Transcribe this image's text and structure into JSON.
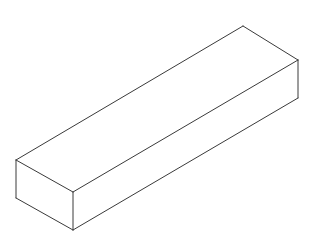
{
  "canvas": {
    "width": 315,
    "height": 242,
    "background_color": "#ffffff",
    "title": "Isometric rectangular box (beam) wireframe drawing"
  },
  "drawing": {
    "name": "rectangular-box",
    "type": "isometric-line-drawing",
    "line_color": "#3a3a3a",
    "line_width": 1,
    "fill_color": "#ffffff",
    "description": "A long rectangular box (cuboid / beam) drawn in isometric projection, outlined in thin dark gray lines on a white background. Three faces are visible: the large top face, the left end face, and the long front-lower face.",
    "vertices": {
      "top_back_left": {
        "x": 16,
        "y": 160
      },
      "top_back_apex": {
        "x": 243,
        "y": 26
      },
      "top_front_right": {
        "x": 298,
        "y": 60
      },
      "top_front_center": {
        "x": 73,
        "y": 192
      },
      "bottom_front_left": {
        "x": 16,
        "y": 198
      },
      "bottom_front_center": {
        "x": 73,
        "y": 230
      },
      "bottom_front_right": {
        "x": 298,
        "y": 98
      }
    },
    "faces": [
      {
        "name": "top-face",
        "label": "Top Face",
        "points": "16,160 243,26 298,60 73,192"
      },
      {
        "name": "left-end-face",
        "label": "Left End Face",
        "points": "16,160 73,192 73,230 16,198"
      },
      {
        "name": "front-face",
        "label": "Front Long Face",
        "points": "73,192 298,60 298,98 73,230"
      }
    ],
    "edges": [
      {
        "name": "top-back-long-edge",
        "label": "Top back long edge",
        "x1": 16,
        "y1": 160,
        "x2": 243,
        "y2": 26
      },
      {
        "name": "top-right-short-edge",
        "label": "Top right short edge",
        "x1": 243,
        "y1": 26,
        "x2": 298,
        "y2": 60
      },
      {
        "name": "top-front-long-edge",
        "label": "Top front long edge",
        "x1": 73,
        "y1": 192,
        "x2": 298,
        "y2": 60
      },
      {
        "name": "top-left-short-edge",
        "label": "Top left short edge",
        "x1": 16,
        "y1": 160,
        "x2": 73,
        "y2": 192
      },
      {
        "name": "left-vertical-edge",
        "label": "Left vertical edge",
        "x1": 16,
        "y1": 160,
        "x2": 16,
        "y2": 198
      },
      {
        "name": "center-vertical-edge",
        "label": "Front corner vertical edge",
        "x1": 73,
        "y1": 192,
        "x2": 73,
        "y2": 230
      },
      {
        "name": "right-vertical-edge",
        "label": "Right vertical edge",
        "x1": 298,
        "y1": 60,
        "x2": 298,
        "y2": 98
      },
      {
        "name": "bottom-left-short-edge",
        "label": "Bottom left short edge",
        "x1": 16,
        "y1": 198,
        "x2": 73,
        "y2": 230
      },
      {
        "name": "bottom-front-long-edge",
        "label": "Bottom front long edge",
        "x1": 73,
        "y1": 230,
        "x2": 298,
        "y2": 98
      }
    ]
  }
}
